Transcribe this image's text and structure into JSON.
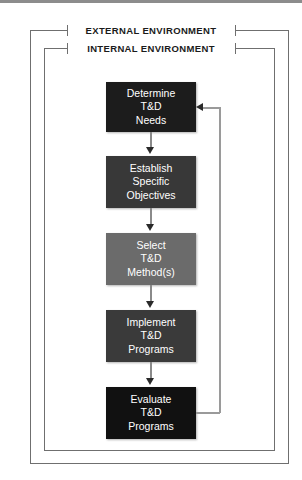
{
  "diagram": {
    "environments": [
      {
        "name": "external-environment",
        "label": "EXTERNAL ENVIRONMENT"
      },
      {
        "name": "internal-environment",
        "label": "INTERNAL ENVIRONMENT"
      }
    ],
    "steps": [
      {
        "name": "determine-td-needs",
        "lines": [
          "Determine",
          "T&D",
          "Needs"
        ],
        "line1": "Determine",
        "line2": "T&D",
        "line3": "Needs",
        "fill": "#1c1c1c"
      },
      {
        "name": "establish-specific-objectives",
        "lines": [
          "Establish",
          "Specific",
          "Objectives"
        ],
        "line1": "Establish",
        "line2": "Specific",
        "line3": "Objectives",
        "fill": "#383838"
      },
      {
        "name": "select-td-methods",
        "lines": [
          "Select",
          "T&D",
          "Method(s)"
        ],
        "line1": "Select",
        "line2": "T&D",
        "line3": "Method(s)",
        "fill": "#6b6b6b"
      },
      {
        "name": "implement-td-programs",
        "lines": [
          "Implement",
          "T&D",
          "Programs"
        ],
        "line1": "Implement",
        "line2": "T&D",
        "line3": "Programs",
        "fill": "#3a3a3a"
      },
      {
        "name": "evaluate-td-programs",
        "lines": [
          "Evaluate",
          "T&D",
          "Programs"
        ],
        "line1": "Evaluate",
        "line2": "T&D",
        "line3": "Programs",
        "fill": "#111111"
      }
    ],
    "colors": {
      "frame_line": "#6f6f6f",
      "connector": "#8a8a8a",
      "arrow": "#2a2a2a",
      "feedback_line": "#9a9a9a",
      "box_text": "#ffffff",
      "label_text": "#1b1b1b",
      "background": "#ffffff"
    },
    "feedback": {
      "name": "feedback-loop",
      "from": "evaluate-td-programs",
      "to": "determine-td-needs"
    }
  }
}
